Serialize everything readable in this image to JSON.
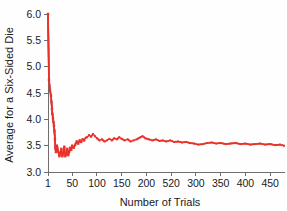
{
  "chart_data": {
    "type": "line",
    "title": "",
    "xlabel": "Number of Trials",
    "ylabel": "Average for a Six-Sided Die",
    "xlim": [
      1,
      480
    ],
    "ylim": [
      3.0,
      6.0
    ],
    "grid": false,
    "legend": "none",
    "marker_color": "#e8322a",
    "line_color": "#4a7fc1",
    "xticks": [
      1,
      50,
      100,
      150,
      200,
      250,
      300,
      350,
      400,
      450
    ],
    "xtick_labels": [
      "1",
      "50",
      "100",
      "150",
      "200",
      "520",
      "300",
      "350",
      "400",
      "450"
    ],
    "yticks": [
      3.0,
      3.5,
      4.0,
      4.5,
      5.0,
      5.5,
      6.0
    ],
    "ytick_labels": [
      "3.0",
      "3.5",
      "4.0",
      "4.5",
      "5.0",
      "5.5",
      "6.0"
    ],
    "series": [
      {
        "name": "Running average of die rolls",
        "x": [
          1,
          3,
          5,
          7,
          8,
          9,
          10,
          11,
          12,
          13,
          14,
          15,
          16,
          17,
          18,
          19,
          20,
          22,
          24,
          26,
          28,
          30,
          32,
          34,
          36,
          38,
          40,
          42,
          44,
          46,
          48,
          50,
          53,
          56,
          59,
          62,
          65,
          68,
          71,
          74,
          77,
          80,
          84,
          88,
          92,
          96,
          100,
          105,
          110,
          115,
          120,
          125,
          130,
          135,
          140,
          145,
          150,
          156,
          162,
          168,
          174,
          180,
          186,
          192,
          198,
          205,
          212,
          219,
          226,
          233,
          240,
          248,
          256,
          264,
          272,
          280,
          288,
          296,
          305,
          314,
          323,
          332,
          341,
          350,
          360,
          370,
          380,
          390,
          400,
          410,
          420,
          430,
          440,
          450,
          460,
          470,
          478
        ],
        "y": [
          6.0,
          4.75,
          4.55,
          4.45,
          4.33,
          4.2,
          4.1,
          4.02,
          3.95,
          3.88,
          3.78,
          3.62,
          3.45,
          3.38,
          3.42,
          3.5,
          3.46,
          3.38,
          3.3,
          3.36,
          3.44,
          3.3,
          3.36,
          3.48,
          3.3,
          3.34,
          3.44,
          3.32,
          3.39,
          3.46,
          3.42,
          3.5,
          3.46,
          3.52,
          3.58,
          3.54,
          3.6,
          3.57,
          3.62,
          3.6,
          3.65,
          3.66,
          3.7,
          3.67,
          3.72,
          3.68,
          3.64,
          3.6,
          3.62,
          3.58,
          3.6,
          3.63,
          3.6,
          3.64,
          3.62,
          3.66,
          3.63,
          3.6,
          3.62,
          3.58,
          3.6,
          3.62,
          3.65,
          3.68,
          3.64,
          3.62,
          3.6,
          3.62,
          3.59,
          3.6,
          3.58,
          3.6,
          3.57,
          3.58,
          3.56,
          3.57,
          3.55,
          3.54,
          3.52,
          3.53,
          3.55,
          3.56,
          3.54,
          3.55,
          3.53,
          3.54,
          3.55,
          3.53,
          3.54,
          3.52,
          3.53,
          3.54,
          3.52,
          3.53,
          3.51,
          3.52,
          3.5
        ]
      }
    ]
  }
}
